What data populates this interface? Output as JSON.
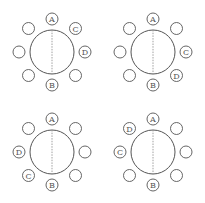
{
  "diagram": {
    "type": "seating-arrangements",
    "tables": [
      {
        "id": "table-1",
        "cx": 52,
        "cy": 52,
        "seats": [
          "A",
          "C",
          "D",
          "",
          "B",
          "",
          "",
          ""
        ]
      },
      {
        "id": "table-2",
        "cx": 153,
        "cy": 52,
        "seats": [
          "A",
          "",
          "C",
          "D",
          "B",
          "",
          "",
          ""
        ]
      },
      {
        "id": "table-3",
        "cx": 52,
        "cy": 152,
        "seats": [
          "A",
          "",
          "",
          "",
          "B",
          "C",
          "D",
          ""
        ]
      },
      {
        "id": "table-4",
        "cx": 153,
        "cy": 152,
        "seats": [
          "A",
          "",
          "",
          "",
          "B",
          "",
          "C",
          "D"
        ]
      }
    ],
    "seat_order_note": "clockwise from top: top, top-right, right, bottom-right, bottom, bottom-left, left, top-left",
    "colors": {
      "stroke": "#555555",
      "divider": "#888888",
      "background": "#ffffff"
    }
  }
}
